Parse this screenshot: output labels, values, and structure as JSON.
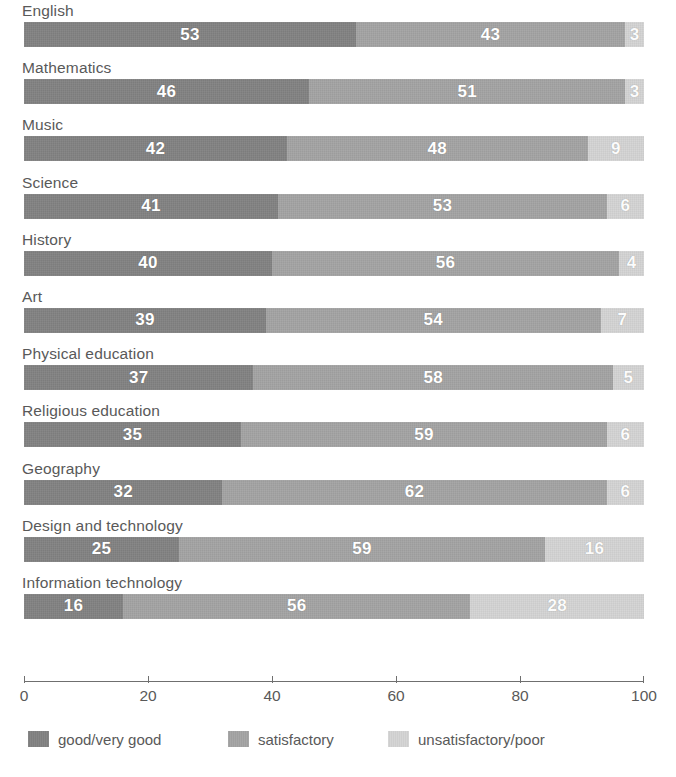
{
  "chart_data": {
    "type": "bar",
    "orientation": "horizontal",
    "stacked": true,
    "title": "",
    "subtitle": "",
    "xlabel": "",
    "ylabel": "",
    "xlim": [
      0,
      100
    ],
    "grid": false,
    "legend_position": "bottom",
    "axis_ticks": [
      "0",
      "20",
      "40",
      "60",
      "80",
      "100"
    ],
    "axis_tick_values": [
      0,
      20,
      40,
      60,
      80,
      100
    ],
    "categories": [
      "English",
      "Mathematics",
      "Music",
      "Science",
      "History",
      "Art",
      "Physical education",
      "Religious education",
      "Geography",
      "Design and technology",
      "Information technology"
    ],
    "series": [
      {
        "name": "good/very good",
        "color": "#828282",
        "values": [
          53,
          46,
          42,
          41,
          40,
          39,
          37,
          35,
          32,
          25,
          16
        ]
      },
      {
        "name": "satisfactory",
        "color": "#a4a4a4",
        "values": [
          43,
          51,
          48,
          53,
          56,
          54,
          58,
          59,
          62,
          59,
          56
        ]
      },
      {
        "name": "unsatisfactory/poor",
        "color": "#d4d4d4",
        "values": [
          3,
          3,
          9,
          6,
          4,
          7,
          5,
          6,
          6,
          16,
          28
        ]
      }
    ],
    "rows": [
      {
        "label": "English",
        "values": [
          53,
          43,
          3
        ]
      },
      {
        "label": "Mathematics",
        "values": [
          46,
          51,
          3
        ]
      },
      {
        "label": "Music",
        "values": [
          42,
          48,
          9
        ]
      },
      {
        "label": "Science",
        "values": [
          41,
          53,
          6
        ]
      },
      {
        "label": "History",
        "values": [
          40,
          56,
          4
        ]
      },
      {
        "label": "Art",
        "values": [
          39,
          54,
          7
        ]
      },
      {
        "label": "Physical education",
        "values": [
          37,
          58,
          5
        ]
      },
      {
        "label": "Religious education",
        "values": [
          35,
          59,
          6
        ]
      },
      {
        "label": "Geography",
        "values": [
          32,
          62,
          6
        ]
      },
      {
        "label": "Design and technology",
        "values": [
          25,
          59,
          16
        ]
      },
      {
        "label": "Information technology",
        "values": [
          16,
          56,
          28
        ]
      }
    ]
  },
  "legend": {
    "items": [
      {
        "label": "good/very good",
        "color": "#828282",
        "left": 28
      },
      {
        "label": "satisfactory",
        "color": "#a4a4a4",
        "left": 228
      },
      {
        "label": "unsatisfactory/poor",
        "color": "#d4d4d4",
        "left": 388
      }
    ]
  },
  "colors": {
    "segment_dark": "#828282",
    "segment_mid": "#a4a4a4",
    "segment_light": "#d4d4d4",
    "text": "#595959",
    "axis": "#6f6f6f",
    "value_text": "#ffffff",
    "background": "#ffffff"
  }
}
